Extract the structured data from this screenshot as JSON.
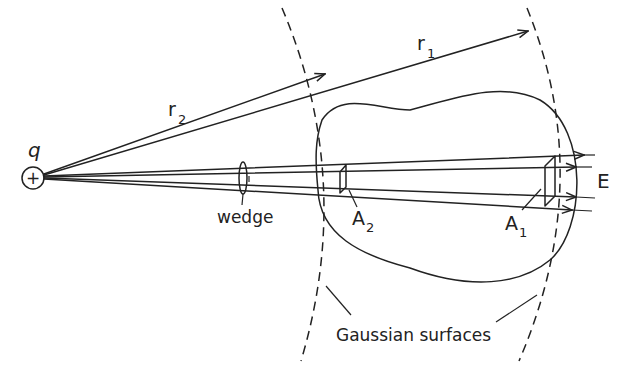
{
  "diagram": {
    "labels": {
      "charge": "q",
      "charge_sign": "+",
      "r1_base": "r",
      "r1_sub": "1",
      "r2_base": "r",
      "r2_sub": "2",
      "wedge": "wedge",
      "a1_base": "A",
      "a1_sub": "1",
      "a2_base": "A",
      "a2_sub": "2",
      "field": "E",
      "surfaces": "Gaussian surfaces"
    },
    "colors": {
      "ink": "#222222",
      "background": "#ffffff"
    }
  }
}
